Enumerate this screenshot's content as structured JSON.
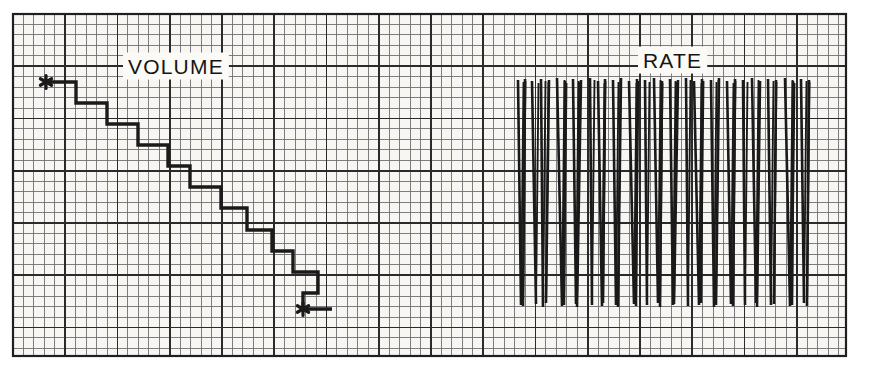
{
  "document": {
    "type": "strip-chart-recorder-trace",
    "title": "Infusion pump strip chart recording",
    "background_color": "#f7f6f3",
    "ink_color": "#1a1a1a",
    "grid_minor_color": "#6f6f72",
    "grid_major_color": "#2a2a2d"
  },
  "paper": {
    "left": 13,
    "top": 14,
    "right": 846,
    "bottom": 356,
    "minor_step": 10.45,
    "major_every": 5,
    "border_width": 2
  },
  "labels": {
    "volume": "VOLUME",
    "rate": "RATE",
    "volume_x": 128,
    "volume_y": 68,
    "rate_x": 643,
    "rate_y": 62
  },
  "markers": [
    {
      "name": "volume-start-marker",
      "glyph": "asterisk",
      "x": 46,
      "y": 82
    },
    {
      "name": "volume-end-marker",
      "glyph": "asterisk",
      "x": 303,
      "y": 309
    }
  ],
  "chart_data": {
    "type": "line",
    "xlabel": "",
    "ylabel": "",
    "grid": true,
    "legend": false,
    "series": [
      {
        "name": "VOLUME",
        "style": "descending-staircase",
        "stroke_width": 3.4,
        "annotation": "step-decrement trace marked at both ends with asterisks",
        "points": [
          [
            46,
            82
          ],
          [
            76,
            82
          ],
          [
            76,
            103
          ],
          [
            107,
            103
          ],
          [
            107,
            124
          ],
          [
            138,
            124
          ],
          [
            138,
            145
          ],
          [
            168,
            145
          ],
          [
            168,
            166
          ],
          [
            190,
            166
          ],
          [
            190,
            187
          ],
          [
            221,
            187
          ],
          [
            221,
            208
          ],
          [
            247,
            208
          ],
          [
            247,
            230
          ],
          [
            272,
            230
          ],
          [
            272,
            251
          ],
          [
            293,
            251
          ],
          [
            293,
            272
          ],
          [
            318,
            272
          ],
          [
            318,
            293
          ],
          [
            303,
            293
          ],
          [
            303,
            309
          ],
          [
            332,
            309
          ]
        ]
      },
      {
        "name": "RATE",
        "style": "dense-vertical-spikes",
        "stroke_width": 2.6,
        "annotation": "dense band of near-vertical oscillation strokes",
        "band": {
          "x_start": 517,
          "x_end": 813,
          "y_top": 78,
          "y_bottom": 307
        },
        "spikes": [
          {
            "x": 518,
            "top": 80,
            "bottom": 305,
            "lean": 3
          },
          {
            "x": 525,
            "top": 79,
            "bottom": 306,
            "lean": -2
          },
          {
            "x": 532,
            "top": 81,
            "bottom": 304,
            "lean": 4
          },
          {
            "x": 541,
            "top": 79,
            "bottom": 307,
            "lean": 2
          },
          {
            "x": 549,
            "top": 80,
            "bottom": 303,
            "lean": -3
          },
          {
            "x": 557,
            "top": 78,
            "bottom": 306,
            "lean": 5
          },
          {
            "x": 565,
            "top": 81,
            "bottom": 305,
            "lean": -1
          },
          {
            "x": 573,
            "top": 79,
            "bottom": 304,
            "lean": 3
          },
          {
            "x": 581,
            "top": 80,
            "bottom": 307,
            "lean": -4
          },
          {
            "x": 590,
            "top": 78,
            "bottom": 305,
            "lean": 2
          },
          {
            "x": 598,
            "top": 81,
            "bottom": 306,
            "lean": 4
          },
          {
            "x": 605,
            "top": 79,
            "bottom": 303,
            "lean": -2
          },
          {
            "x": 613,
            "top": 80,
            "bottom": 305,
            "lean": 3
          },
          {
            "x": 621,
            "top": 78,
            "bottom": 307,
            "lean": -3
          },
          {
            "x": 629,
            "top": 81,
            "bottom": 304,
            "lean": 5
          },
          {
            "x": 637,
            "top": 79,
            "bottom": 306,
            "lean": -1
          },
          {
            "x": 645,
            "top": 80,
            "bottom": 305,
            "lean": 2
          },
          {
            "x": 654,
            "top": 78,
            "bottom": 303,
            "lean": 4
          },
          {
            "x": 662,
            "top": 81,
            "bottom": 307,
            "lean": -2
          },
          {
            "x": 670,
            "top": 79,
            "bottom": 305,
            "lean": 3
          },
          {
            "x": 678,
            "top": 80,
            "bottom": 304,
            "lean": -4
          },
          {
            "x": 686,
            "top": 78,
            "bottom": 306,
            "lean": 2
          },
          {
            "x": 694,
            "top": 81,
            "bottom": 305,
            "lean": 5
          },
          {
            "x": 702,
            "top": 79,
            "bottom": 303,
            "lean": -1
          },
          {
            "x": 711,
            "top": 80,
            "bottom": 307,
            "lean": 3
          },
          {
            "x": 719,
            "top": 78,
            "bottom": 305,
            "lean": -3
          },
          {
            "x": 727,
            "top": 81,
            "bottom": 304,
            "lean": 4
          },
          {
            "x": 735,
            "top": 79,
            "bottom": 306,
            "lean": -2
          },
          {
            "x": 743,
            "top": 80,
            "bottom": 305,
            "lean": 2
          },
          {
            "x": 752,
            "top": 78,
            "bottom": 303,
            "lean": 4
          },
          {
            "x": 760,
            "top": 81,
            "bottom": 307,
            "lean": -3
          },
          {
            "x": 768,
            "top": 79,
            "bottom": 305,
            "lean": 3
          },
          {
            "x": 776,
            "top": 80,
            "bottom": 304,
            "lean": -2
          },
          {
            "x": 785,
            "top": 78,
            "bottom": 306,
            "lean": 5
          },
          {
            "x": 793,
            "top": 81,
            "bottom": 305,
            "lean": -1
          },
          {
            "x": 801,
            "top": 79,
            "bottom": 303,
            "lean": 3
          },
          {
            "x": 809,
            "top": 80,
            "bottom": 306,
            "lean": -2
          }
        ]
      }
    ]
  }
}
